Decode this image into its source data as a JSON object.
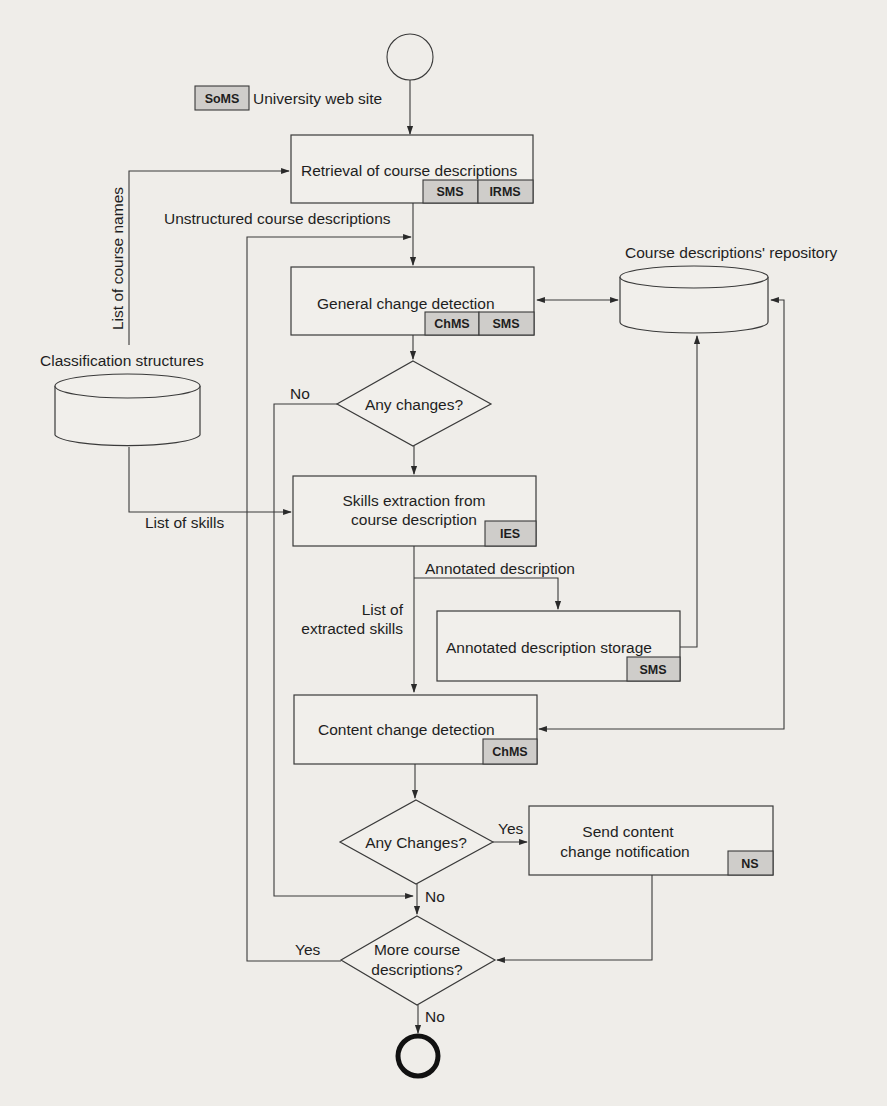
{
  "diagram": {
    "start_node": "start",
    "end_node": "end",
    "source": {
      "tag": "SoMS",
      "label": "University web site"
    },
    "processes": {
      "retrieval": {
        "label": "Retrieval of course descriptions",
        "tags": [
          "SMS",
          "IRMS"
        ]
      },
      "general_change": {
        "label": "General change detection",
        "tags": [
          "ChMS",
          "SMS"
        ]
      },
      "skills_extraction": {
        "line1": "Skills extraction from",
        "line2": "course description",
        "tags": [
          "IES"
        ]
      },
      "annotated_storage": {
        "label": "Annotated description storage",
        "tags": [
          "SMS"
        ]
      },
      "content_change": {
        "label": "Content change detection",
        "tags": [
          "ChMS"
        ]
      },
      "notification": {
        "line1": "Send content",
        "line2": "change notification",
        "tags": [
          "NS"
        ]
      }
    },
    "decisions": {
      "any_changes_1": {
        "label": "Any changes?",
        "no": "No"
      },
      "any_changes_2": {
        "label": "Any Changes?",
        "yes": "Yes",
        "no": "No"
      },
      "more_descriptions": {
        "line1": "More course",
        "line2": "descriptions?",
        "yes": "Yes",
        "no": "No"
      }
    },
    "datastores": {
      "classification": {
        "label": "Classification structures"
      },
      "repository": {
        "label": "Course descriptions' repository"
      }
    },
    "edge_labels": {
      "course_names": "List of course names",
      "unstructured": "Unstructured course descriptions",
      "skills_list": "List of skills",
      "annotated": "Annotated description",
      "extracted_line1": "List of",
      "extracted_line2": "extracted skills"
    }
  }
}
